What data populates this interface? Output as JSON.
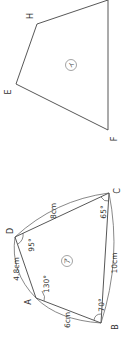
{
  "figure_i": {
    "shape_label": "イ",
    "vertices": [
      {
        "name": "E",
        "x": 16,
        "y": 84
      },
      {
        "name": "F",
        "x": 108,
        "y": 130
      },
      {
        "name": "G",
        "x": 108,
        "y": 0
      },
      {
        "name": "H",
        "x": 37,
        "y": 24
      }
    ],
    "labels": {
      "E": "E",
      "F": "F",
      "H": "H"
    }
  },
  "figure_a": {
    "shape_label": "ア",
    "vertices": [
      {
        "name": "A",
        "x": 36,
        "y": 298
      },
      {
        "name": "B",
        "x": 101,
        "y": 323
      },
      {
        "name": "C",
        "x": 109,
        "y": 193
      },
      {
        "name": "D",
        "x": 15,
        "y": 237
      }
    ],
    "labels": {
      "A": "A",
      "B": "B",
      "C": "C",
      "D": "D"
    },
    "sides": {
      "AD": "4.8cm",
      "AB": "6cm",
      "BC": "10cm",
      "CD": "8cm"
    },
    "angles": {
      "A": "130°",
      "B": "70°",
      "C": "65°",
      "D": "95°"
    }
  }
}
